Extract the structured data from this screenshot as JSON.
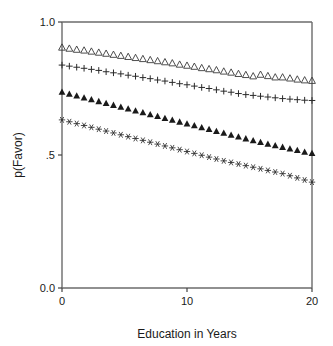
{
  "chart_data": {
    "type": "scatter",
    "title": "",
    "xlabel": "Education in Years",
    "ylabel": "p(Favor)",
    "xlim": [
      0,
      20
    ],
    "ylim": [
      0.0,
      1.0
    ],
    "grid": false,
    "legend": "none",
    "xticks": [
      "0",
      "10",
      "20"
    ],
    "xtick_values": [
      0,
      10,
      20
    ],
    "yticks": [
      "0.0",
      ".5",
      "1.0"
    ],
    "ytick_values": [
      0.0,
      0.5,
      1.0
    ],
    "x": [
      0,
      0.588,
      1.176,
      1.765,
      2.353,
      2.941,
      3.529,
      4.118,
      4.706,
      5.294,
      5.882,
      6.471,
      7.059,
      7.647,
      8.235,
      8.824,
      9.412,
      10.0,
      10.588,
      11.176,
      11.765,
      12.353,
      12.941,
      13.529,
      14.118,
      14.706,
      15.294,
      15.882,
      16.471,
      17.059,
      17.647,
      18.235,
      18.824,
      19.412,
      20.0
    ],
    "series": [
      {
        "name": "open-triangle-series",
        "marker": "open-triangle",
        "color": "#3a3a3a",
        "values": [
          0.905,
          0.901,
          0.897,
          0.894,
          0.89,
          0.886,
          0.882,
          0.878,
          0.874,
          0.87,
          0.866,
          0.862,
          0.858,
          0.854,
          0.85,
          0.846,
          0.841,
          0.837,
          0.833,
          0.828,
          0.824,
          0.82,
          0.815,
          0.811,
          0.806,
          0.802,
          0.797,
          0.803,
          0.798,
          0.793,
          0.793,
          0.789,
          0.785,
          0.782,
          0.78
        ]
      },
      {
        "name": "plus-series",
        "marker": "plus",
        "color": "#2a2a2a",
        "values": [
          0.838,
          0.834,
          0.83,
          0.826,
          0.822,
          0.818,
          0.813,
          0.809,
          0.805,
          0.8,
          0.796,
          0.791,
          0.787,
          0.782,
          0.778,
          0.773,
          0.768,
          0.764,
          0.759,
          0.754,
          0.75,
          0.745,
          0.74,
          0.736,
          0.731,
          0.727,
          0.724,
          0.721,
          0.718,
          0.715,
          0.712,
          0.71,
          0.708,
          0.706,
          0.705
        ]
      },
      {
        "name": "filled-triangle-series",
        "marker": "filled-triangle",
        "color": "#1a1a1a",
        "values": [
          0.737,
          0.73,
          0.723,
          0.716,
          0.709,
          0.702,
          0.695,
          0.688,
          0.681,
          0.674,
          0.667,
          0.66,
          0.653,
          0.646,
          0.639,
          0.632,
          0.625,
          0.618,
          0.611,
          0.604,
          0.597,
          0.59,
          0.583,
          0.576,
          0.569,
          0.562,
          0.555,
          0.548,
          0.542,
          0.536,
          0.53,
          0.524,
          0.518,
          0.512,
          0.507
        ]
      },
      {
        "name": "asterisk-series",
        "marker": "asterisk",
        "color": "#2a2a2a",
        "values": [
          0.632,
          0.625,
          0.618,
          0.611,
          0.604,
          0.597,
          0.59,
          0.583,
          0.576,
          0.569,
          0.562,
          0.555,
          0.548,
          0.541,
          0.534,
          0.527,
          0.52,
          0.513,
          0.506,
          0.499,
          0.492,
          0.485,
          0.478,
          0.472,
          0.466,
          0.46,
          0.454,
          0.448,
          0.442,
          0.436,
          0.43,
          0.422,
          0.414,
          0.406,
          0.398
        ]
      }
    ]
  }
}
